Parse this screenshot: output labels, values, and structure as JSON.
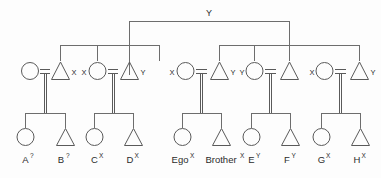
{
  "diagram": {
    "type": "kinship-pedigree-chart",
    "title_marker": "Y",
    "legend": {
      "female_symbol": "circle",
      "male_symbol": "triangle",
      "marriage_symbol": "=",
      "descent_symbol": "vertical-line"
    },
    "apex": {
      "label": "Y",
      "name": "apex-ancestor-marker"
    },
    "couples": [
      {
        "id": "couple-1",
        "female": {
          "symbol": "circle",
          "marker": ""
        },
        "male": {
          "symbol": "triangle",
          "marker": "X"
        },
        "marriage": "=",
        "children": [
          {
            "label": "A",
            "superscript": "?",
            "symbol": "circle"
          },
          {
            "label": "B",
            "superscript": "?",
            "symbol": "triangle"
          }
        ]
      },
      {
        "id": "couple-2",
        "female": {
          "symbol": "circle",
          "marker": "X"
        },
        "male": {
          "symbol": "triangle",
          "marker": "Y"
        },
        "marriage": "=",
        "children": [
          {
            "label": "C",
            "superscript": "X",
            "symbol": "circle"
          },
          {
            "label": "D",
            "superscript": "X",
            "symbol": "triangle"
          }
        ]
      },
      {
        "id": "couple-3",
        "female": {
          "symbol": "circle",
          "marker": "X"
        },
        "male": {
          "symbol": "triangle",
          "marker": "Y"
        },
        "marriage": "=",
        "children": [
          {
            "label": "Ego",
            "superscript": "X",
            "symbol": "circle"
          },
          {
            "label": "Brother",
            "superscript": "X",
            "symbol": "triangle"
          }
        ]
      },
      {
        "id": "couple-4",
        "female": {
          "symbol": "circle",
          "marker": "Y"
        },
        "male": {
          "symbol": "triangle",
          "marker": ""
        },
        "marriage": "=",
        "children": [
          {
            "label": "E",
            "superscript": "Y",
            "symbol": "circle"
          },
          {
            "label": "F",
            "superscript": "Y",
            "symbol": "triangle"
          }
        ]
      },
      {
        "id": "couple-5",
        "female": {
          "symbol": "circle",
          "marker": "X"
        },
        "male": {
          "symbol": "triangle",
          "marker": "Y"
        },
        "marriage": "=",
        "children": [
          {
            "label": "G",
            "superscript": "X",
            "symbol": "circle"
          },
          {
            "label": "H",
            "superscript": "X",
            "symbol": "triangle"
          }
        ]
      }
    ],
    "names": {
      "child_a": "A",
      "child_a_sup": "?",
      "child_b": "B",
      "child_b_sup": "?",
      "child_c": "C",
      "child_c_sup": "X",
      "child_d": "D",
      "child_d_sup": "X",
      "child_ego": "Ego",
      "child_ego_sup": "X",
      "child_brother": "Brother",
      "child_brother_sup": "X",
      "child_e": "E",
      "child_e_sup": "Y",
      "child_f": "F",
      "child_f_sup": "Y",
      "child_g": "G",
      "child_g_sup": "X",
      "child_h": "H",
      "child_h_sup": "X"
    },
    "markers": {
      "m1_male": "X",
      "m2_female": "X",
      "m2_male": "Y",
      "m3_female": "X",
      "m3_male": "Y",
      "m4_female": "Y",
      "m5_female": "X",
      "m5_male": "Y"
    },
    "marriage_glyphs": {
      "eq1": "=",
      "eq2": "=",
      "eq3": "=",
      "eq4": "=",
      "eq5": "="
    },
    "colors": {
      "background": "#fdfdfd",
      "line": "#6d6d6d",
      "shape": "#5a5a5a",
      "text": "#2b2b2b"
    }
  }
}
